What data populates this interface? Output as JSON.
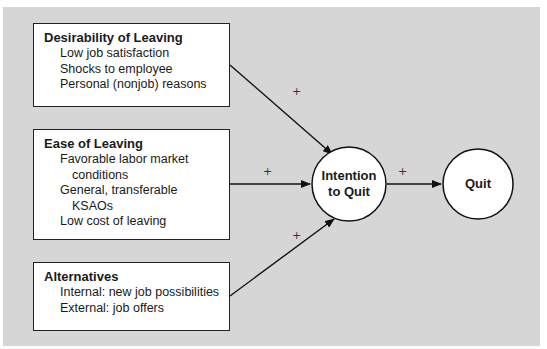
{
  "diagram": {
    "boxes": [
      {
        "title": "Desirability of Leaving",
        "items": [
          "Low job satisfaction",
          "Shocks to employee",
          "Personal (nonjob) reasons"
        ]
      },
      {
        "title": "Ease of Leaving",
        "items": [
          "Favorable labor market",
          "conditions",
          "General, transferable",
          "KSAOs",
          "Low cost of leaving"
        ]
      },
      {
        "title": "Alternatives",
        "items": [
          "Internal: new job possibilities",
          "External: job offers"
        ]
      }
    ],
    "nodes": {
      "intention_line1": "Intention",
      "intention_line2": "to Quit",
      "quit": "Quit"
    },
    "signs": {
      "desirability": "+",
      "ease": "+",
      "alternatives": "+",
      "intention_to_quit": "+"
    },
    "colors": {
      "background": "#d6d6d6",
      "box": "#ffffff",
      "stroke": "#222222"
    }
  }
}
